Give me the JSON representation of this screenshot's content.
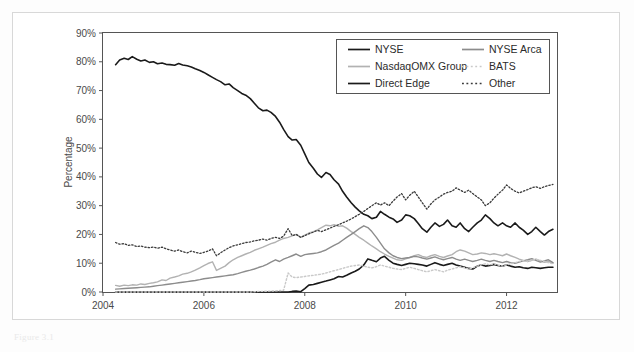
{
  "figure": {
    "caption": "Figure 3.1",
    "background_color": "#ffffff",
    "frame_color": "#d8d8d8"
  },
  "chart_data": {
    "type": "line",
    "title": "",
    "subtitle": "",
    "xlabel": "",
    "ylabel": "Percentage",
    "xlim": [
      2004.0,
      2013.0
    ],
    "ylim": [
      0,
      90
    ],
    "grid": false,
    "legend_position": "top-right",
    "y_ticks": [
      "0%",
      "10%",
      "20%",
      "30%",
      "40%",
      "50%",
      "60%",
      "70%",
      "80%",
      "90%"
    ],
    "y_tick_values": [
      0,
      10,
      20,
      30,
      40,
      50,
      60,
      70,
      80,
      90
    ],
    "x_ticks": [
      "2004",
      "2006",
      "2008",
      "2010",
      "2012"
    ],
    "x_tick_values": [
      2004,
      2006,
      2008,
      2010,
      2012
    ],
    "x": [
      2004.25,
      2004.33,
      2004.42,
      2004.5,
      2004.58,
      2004.67,
      2004.75,
      2004.83,
      2004.92,
      2005.0,
      2005.08,
      2005.17,
      2005.25,
      2005.33,
      2005.42,
      2005.5,
      2005.58,
      2005.67,
      2005.75,
      2005.83,
      2005.92,
      2006.0,
      2006.08,
      2006.17,
      2006.25,
      2006.33,
      2006.42,
      2006.5,
      2006.58,
      2006.67,
      2006.75,
      2006.83,
      2006.92,
      2007.0,
      2007.08,
      2007.17,
      2007.25,
      2007.33,
      2007.42,
      2007.5,
      2007.58,
      2007.67,
      2007.75,
      2007.83,
      2007.92,
      2008.0,
      2008.08,
      2008.17,
      2008.25,
      2008.33,
      2008.42,
      2008.5,
      2008.58,
      2008.67,
      2008.75,
      2008.83,
      2008.92,
      2009.0,
      2009.08,
      2009.17,
      2009.25,
      2009.33,
      2009.42,
      2009.5,
      2009.58,
      2009.67,
      2009.75,
      2009.83,
      2009.92,
      2010.0,
      2010.08,
      2010.17,
      2010.25,
      2010.33,
      2010.42,
      2010.5,
      2010.58,
      2010.67,
      2010.75,
      2010.83,
      2010.92,
      2011.0,
      2011.08,
      2011.17,
      2011.25,
      2011.33,
      2011.42,
      2011.5,
      2011.58,
      2011.67,
      2011.75,
      2011.83,
      2011.92,
      2012.0,
      2012.08,
      2012.17,
      2012.25,
      2012.33,
      2012.42,
      2012.5,
      2012.58,
      2012.67,
      2012.75,
      2012.83,
      2012.92
    ],
    "series": [
      {
        "name": "NYSE",
        "color": "#1a1a1a",
        "style": "solid",
        "width": 1.6,
        "values": [
          79.0,
          80.6,
          81.2,
          80.8,
          81.8,
          80.9,
          80.3,
          80.6,
          79.8,
          80.0,
          79.3,
          79.6,
          79.1,
          79.0,
          78.8,
          79.4,
          78.9,
          78.6,
          78.2,
          77.6,
          77.0,
          76.3,
          75.5,
          74.6,
          73.8,
          73.1,
          72.0,
          72.3,
          71.0,
          70.0,
          69.0,
          68.4,
          67.2,
          65.6,
          64.0,
          63.0,
          63.2,
          62.4,
          61.0,
          59.0,
          56.5,
          54.0,
          52.8,
          53.0,
          51.0,
          48.0,
          45.0,
          43.0,
          41.0,
          39.8,
          41.5,
          40.8,
          39.0,
          37.5,
          35.0,
          33.0,
          31.0,
          29.5,
          28.2,
          27.0,
          26.5,
          25.5,
          26.0,
          28.0,
          27.0,
          26.0,
          25.4,
          24.2,
          25.0,
          26.8,
          26.5,
          25.5,
          23.8,
          22.0,
          20.8,
          22.5,
          24.0,
          22.8,
          23.5,
          25.0,
          23.0,
          22.5,
          24.0,
          22.0,
          21.0,
          22.5,
          24.0,
          25.0,
          26.8,
          25.5,
          24.0,
          23.0,
          24.0,
          23.0,
          22.5,
          24.0,
          22.5,
          21.5,
          20.0,
          21.0,
          22.5,
          21.0,
          19.8,
          21.0,
          21.8
        ]
      },
      {
        "name": "NasdaqOMX Group",
        "color": "#b2b2b2",
        "style": "solid",
        "width": 1.4,
        "values": [
          2.3,
          2.0,
          2.4,
          2.2,
          2.5,
          2.4,
          2.8,
          2.6,
          3.0,
          3.2,
          3.5,
          4.2,
          4.0,
          4.8,
          5.2,
          5.6,
          6.2,
          6.5,
          7.0,
          7.6,
          8.4,
          9.2,
          9.9,
          10.5,
          7.5,
          8.2,
          9.0,
          10.2,
          11.2,
          12.0,
          12.6,
          13.2,
          13.8,
          14.5,
          15.0,
          15.6,
          16.2,
          16.8,
          17.3,
          18.0,
          18.6,
          19.0,
          19.5,
          20.0,
          19.0,
          19.8,
          20.5,
          21.0,
          21.6,
          22.4,
          23.2,
          23.0,
          23.4,
          22.8,
          23.0,
          22.2,
          21.0,
          20.0,
          19.0,
          18.0,
          17.0,
          16.0,
          15.0,
          14.0,
          13.2,
          12.4,
          11.8,
          11.2,
          11.0,
          11.5,
          12.0,
          12.6,
          13.0,
          12.4,
          12.0,
          12.6,
          13.0,
          12.4,
          12.0,
          12.5,
          13.0,
          14.0,
          14.6,
          14.2,
          13.6,
          13.0,
          13.2,
          13.6,
          13.4,
          13.0,
          13.3,
          13.0,
          12.6,
          13.2,
          12.6,
          12.0,
          11.4,
          11.0,
          10.6,
          11.0,
          11.4,
          10.8,
          10.3,
          10.6,
          10.0
        ]
      },
      {
        "name": "Direct Edge",
        "color": "#1a1a1a",
        "style": "solid",
        "width": 1.6,
        "values": [
          0.0,
          0.0,
          0.0,
          0.0,
          0.0,
          0.0,
          0.0,
          0.0,
          0.0,
          0.0,
          0.0,
          0.0,
          0.0,
          0.0,
          0.0,
          0.0,
          0.0,
          0.0,
          0.0,
          0.0,
          0.0,
          0.0,
          0.0,
          0.0,
          0.0,
          0.0,
          0.0,
          0.0,
          0.0,
          0.0,
          0.0,
          0.0,
          0.0,
          0.0,
          0.0,
          0.0,
          0.0,
          0.0,
          0.0,
          0.0,
          0.0,
          0.0,
          0.2,
          0.3,
          0.1,
          1.2,
          2.4,
          2.6,
          3.0,
          3.4,
          3.8,
          4.2,
          4.6,
          5.4,
          5.2,
          5.8,
          6.6,
          7.2,
          8.0,
          9.4,
          11.5,
          11.0,
          10.5,
          11.8,
          12.4,
          11.0,
          10.0,
          9.6,
          9.2,
          9.6,
          10.0,
          9.8,
          9.6,
          9.4,
          9.0,
          9.6,
          10.2,
          9.6,
          9.2,
          9.6,
          10.0,
          9.4,
          9.0,
          8.6,
          8.2,
          8.0,
          9.0,
          9.4,
          9.0,
          9.2,
          9.6,
          9.2,
          9.0,
          9.4,
          9.0,
          8.6,
          8.8,
          8.4,
          8.2,
          8.6,
          8.4,
          8.2,
          8.4,
          8.6,
          8.6
        ]
      },
      {
        "name": "NYSE Arca",
        "color": "#8c8c8c",
        "style": "solid",
        "width": 1.4,
        "values": [
          1.0,
          1.1,
          1.2,
          1.3,
          1.4,
          1.5,
          1.6,
          1.7,
          1.8,
          2.0,
          2.2,
          2.4,
          2.6,
          2.8,
          3.0,
          3.2,
          3.4,
          3.6,
          3.8,
          4.0,
          4.3,
          4.6,
          4.8,
          5.0,
          5.2,
          5.4,
          5.6,
          5.8,
          6.0,
          6.4,
          6.8,
          7.2,
          7.6,
          8.0,
          8.5,
          9.0,
          9.6,
          10.4,
          11.2,
          10.6,
          11.4,
          12.0,
          12.6,
          13.2,
          12.4,
          13.0,
          13.2,
          13.4,
          13.6,
          14.0,
          14.6,
          15.4,
          16.2,
          17.0,
          18.0,
          19.0,
          20.0,
          21.0,
          22.0,
          23.0,
          22.4,
          21.0,
          19.0,
          17.0,
          15.0,
          13.6,
          12.6,
          12.0,
          11.6,
          11.8,
          12.0,
          12.4,
          12.2,
          11.8,
          11.4,
          11.8,
          12.2,
          11.6,
          11.2,
          11.6,
          12.0,
          11.4,
          11.0,
          11.4,
          11.0,
          10.6,
          11.0,
          11.4,
          11.0,
          10.6,
          11.0,
          10.6,
          10.2,
          10.6,
          10.2,
          10.0,
          10.4,
          10.8,
          11.2,
          11.6,
          11.0,
          10.4,
          10.8,
          11.2,
          10.2
        ]
      },
      {
        "name": "BATS",
        "color": "#c9c9c9",
        "style": "dotted",
        "width": 1.4,
        "values": [
          0.0,
          0.0,
          0.0,
          0.0,
          0.0,
          0.0,
          0.0,
          0.0,
          0.0,
          0.0,
          0.0,
          0.0,
          0.0,
          0.0,
          0.0,
          0.0,
          0.0,
          0.0,
          0.0,
          0.0,
          0.0,
          0.0,
          0.0,
          0.0,
          0.0,
          0.0,
          0.0,
          0.0,
          0.0,
          0.0,
          0.0,
          0.0,
          0.0,
          0.1,
          0.2,
          0.2,
          0.3,
          0.3,
          0.4,
          0.5,
          0.6,
          6.6,
          5.2,
          5.0,
          5.2,
          5.4,
          5.6,
          5.8,
          6.0,
          6.2,
          6.6,
          7.0,
          7.4,
          7.8,
          8.2,
          8.6,
          9.0,
          9.2,
          9.4,
          9.0,
          8.6,
          8.4,
          8.8,
          9.4,
          9.0,
          8.6,
          8.2,
          8.0,
          7.8,
          8.2,
          8.6,
          8.2,
          7.8,
          7.4,
          7.0,
          7.4,
          7.8,
          7.4,
          7.0,
          7.6,
          8.0,
          8.4,
          8.8,
          8.4,
          8.0,
          8.4,
          9.0,
          9.4,
          9.8,
          9.4,
          9.8,
          9.4,
          9.0,
          9.4,
          9.8,
          10.2,
          10.6,
          11.0,
          10.6,
          11.0,
          11.4,
          11.0,
          10.6,
          10.2,
          9.8
        ]
      },
      {
        "name": "Other",
        "color": "#3a3a3a",
        "style": "dotted",
        "width": 1.3,
        "values": [
          17.2,
          16.6,
          16.8,
          16.2,
          16.4,
          15.8,
          16.0,
          15.6,
          15.4,
          15.6,
          15.2,
          15.6,
          15.0,
          14.6,
          14.2,
          14.6,
          14.0,
          13.6,
          14.2,
          13.8,
          13.4,
          13.8,
          14.2,
          15.0,
          12.6,
          13.6,
          14.6,
          15.4,
          16.0,
          16.4,
          16.8,
          17.2,
          17.4,
          17.8,
          18.0,
          18.4,
          18.0,
          18.6,
          19.0,
          18.6,
          19.4,
          22.0,
          19.6,
          20.0,
          19.0,
          19.6,
          20.2,
          20.8,
          21.4,
          21.0,
          21.6,
          22.2,
          22.8,
          23.4,
          24.0,
          24.6,
          25.4,
          26.2,
          27.0,
          28.0,
          29.0,
          30.0,
          31.0,
          30.2,
          31.0,
          30.0,
          31.6,
          33.0,
          34.2,
          32.0,
          33.6,
          35.0,
          33.0,
          31.0,
          28.8,
          30.6,
          32.0,
          33.0,
          34.0,
          34.6,
          35.0,
          36.2,
          35.4,
          34.6,
          35.4,
          34.2,
          33.0,
          32.0,
          30.0,
          31.0,
          32.6,
          34.0,
          35.4,
          37.2,
          36.0,
          35.0,
          34.4,
          35.0,
          35.6,
          36.2,
          36.6,
          36.0,
          36.6,
          37.0,
          37.4
        ]
      }
    ]
  },
  "legend": {
    "entries": [
      {
        "label": "NYSE",
        "color": "#1a1a1a",
        "style": "solid",
        "col": 0,
        "row": 0
      },
      {
        "label": "NYSE Arca",
        "color": "#8c8c8c",
        "style": "solid",
        "col": 1,
        "row": 0
      },
      {
        "label": "NasdaqOMX Group",
        "color": "#b2b2b2",
        "style": "solid",
        "col": 0,
        "row": 1
      },
      {
        "label": "BATS",
        "color": "#c9c9c9",
        "style": "dotted",
        "col": 1,
        "row": 1
      },
      {
        "label": "Direct Edge",
        "color": "#1a1a1a",
        "style": "solid",
        "col": 0,
        "row": 2
      },
      {
        "label": "Other",
        "color": "#3a3a3a",
        "style": "dotted",
        "col": 1,
        "row": 2
      }
    ]
  }
}
